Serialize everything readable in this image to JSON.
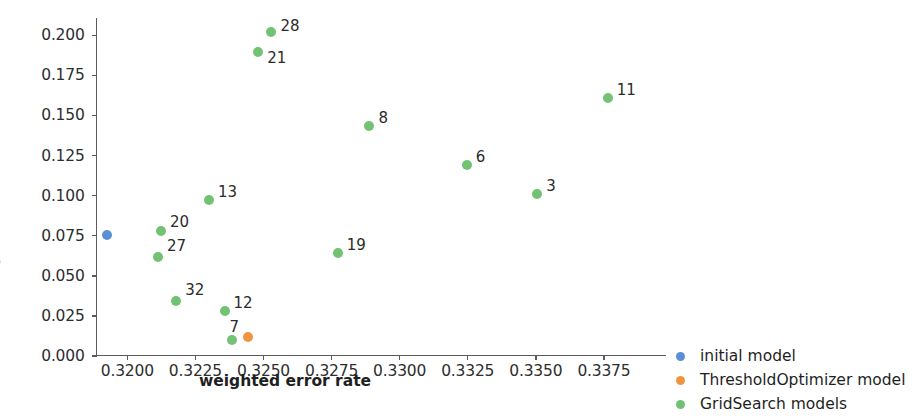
{
  "chart_data": {
    "type": "scatter",
    "title": "",
    "xlabel": "weighted error rate",
    "ylabel": "equalized odds difference",
    "xlim": [
      0.31885,
      0.33978
    ],
    "ylim": [
      0.0,
      0.2108
    ],
    "grid": false,
    "legend_position": "lower-right-outside",
    "xticks": [
      "0.3200",
      "0.3225",
      "0.3250",
      "0.3275",
      "0.3300",
      "0.3325",
      "0.3350",
      "0.3375"
    ],
    "xtick_values": [
      0.32,
      0.3225,
      0.325,
      0.3275,
      0.33,
      0.3325,
      0.335,
      0.3375
    ],
    "yticks": [
      "0.000",
      "0.025",
      "0.050",
      "0.075",
      "0.100",
      "0.125",
      "0.150",
      "0.175",
      "0.200"
    ],
    "ytick_values": [
      0.0,
      0.025,
      0.05,
      0.075,
      0.1,
      0.125,
      0.15,
      0.175,
      0.2
    ],
    "colors": {
      "initial": "#5b8fd4",
      "threshold_optimizer": "#f0953f",
      "grid_search": "#72c274"
    },
    "series": [
      {
        "name": "initial model",
        "color": "#5b8fd4",
        "points": [
          {
            "label": "",
            "x": 0.31925,
            "y": 0.0753
          }
        ]
      },
      {
        "name": "ThresholdOptimizer model",
        "color": "#f0953f",
        "points": [
          {
            "label": "",
            "x": 0.32443,
            "y": 0.012
          }
        ]
      },
      {
        "name": "GridSearch models",
        "color": "#72c274",
        "points": [
          {
            "label": "28",
            "x": 0.32529,
            "y": 0.2018,
            "label_dx": 9,
            "label_dy": -6
          },
          {
            "label": "21",
            "x": 0.32481,
            "y": 0.1898,
            "label_dx": 9,
            "label_dy": 6
          },
          {
            "label": "11",
            "x": 0.33764,
            "y": 0.1608,
            "label_dx": 9,
            "label_dy": -8
          },
          {
            "label": "8",
            "x": 0.32889,
            "y": 0.1434,
            "label_dx": 9,
            "label_dy": -8
          },
          {
            "label": "6",
            "x": 0.33246,
            "y": 0.1193,
            "label_dx": 9,
            "label_dy": -8
          },
          {
            "label": "3",
            "x": 0.33505,
            "y": 0.1012,
            "label_dx": 9,
            "label_dy": -8
          },
          {
            "label": "13",
            "x": 0.323,
            "y": 0.0976,
            "label_dx": 9,
            "label_dy": -8
          },
          {
            "label": "20",
            "x": 0.32124,
            "y": 0.0777,
            "label_dx": 9,
            "label_dy": -9
          },
          {
            "label": "27",
            "x": 0.32113,
            "y": 0.062,
            "label_dx": 9,
            "label_dy": -11
          },
          {
            "label": "19",
            "x": 0.32773,
            "y": 0.0645,
            "label_dx": 9,
            "label_dy": -8
          },
          {
            "label": "32",
            "x": 0.3218,
            "y": 0.0343,
            "label_dx": 9,
            "label_dy": -11
          },
          {
            "label": "12",
            "x": 0.32357,
            "y": 0.0283,
            "label_dx": 9,
            "label_dy": -8
          },
          {
            "label": "7",
            "x": 0.32383,
            "y": 0.0102,
            "label_dx": -2,
            "label_dy": -13
          }
        ]
      }
    ]
  },
  "axes": {
    "x_title": "weighted error rate",
    "y_title": "equalized odds difference"
  },
  "legend": {
    "items": [
      {
        "label": "initial model",
        "color": "#5b8fd4"
      },
      {
        "label": "ThresholdOptimizer model",
        "color": "#f0953f"
      },
      {
        "label": "GridSearch models",
        "color": "#72c274"
      }
    ]
  }
}
